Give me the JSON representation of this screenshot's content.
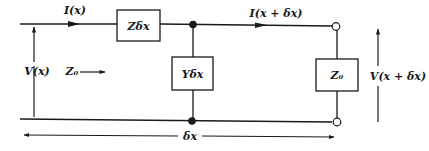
{
  "diagram": {
    "type": "transmission-line-section-equivalent-circuit",
    "labels": {
      "input_current": "I(x)",
      "output_current": "I(x + δx)",
      "input_voltage": "V(x)",
      "output_voltage": "V(x + δx)",
      "series_impedance": "Zδx",
      "shunt_admittance": "Yδx",
      "load_impedance": "Z₀",
      "characteristic_impedance": "Z₀",
      "section_length": "δx"
    },
    "colors": {
      "line": "#1a1a1a",
      "background": "#ffffff"
    }
  }
}
